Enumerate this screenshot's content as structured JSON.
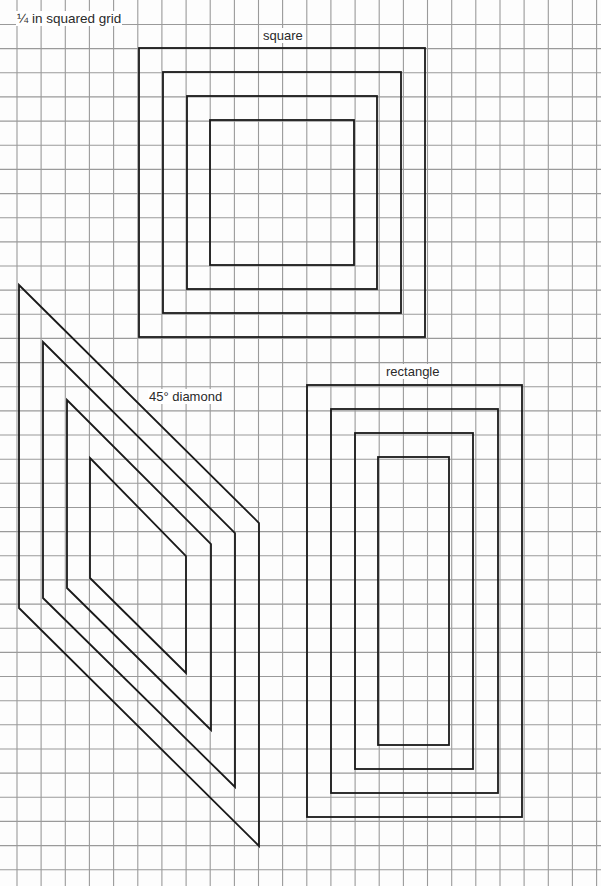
{
  "page": {
    "title": "¼ in squared grid",
    "width": 601,
    "height": 886,
    "background_color": "#fdfdfd"
  },
  "grid": {
    "spacing": 24.15,
    "x_start": 17,
    "y_start": 24.5,
    "line_color": "#9a9a9a",
    "line_width": 1.1
  },
  "shapes": {
    "stroke_color": "#1a1a1a",
    "stroke_width": 1.8,
    "square": {
      "label": "square",
      "label_pos": [
        262,
        28
      ],
      "rects": [
        {
          "x": 139,
          "y": 48,
          "w": 286,
          "h": 289
        },
        {
          "x": 163,
          "y": 72,
          "w": 238,
          "h": 241
        },
        {
          "x": 187,
          "y": 96,
          "w": 190,
          "h": 193
        },
        {
          "x": 210,
          "y": 120,
          "w": 144,
          "h": 145
        }
      ]
    },
    "rectangle": {
      "label": "rectangle",
      "label_pos": [
        385,
        364
      ],
      "rects": [
        {
          "x": 307,
          "y": 385,
          "w": 215,
          "h": 432
        },
        {
          "x": 331,
          "y": 409,
          "w": 167,
          "h": 384
        },
        {
          "x": 355,
          "y": 433,
          "w": 118,
          "h": 336
        },
        {
          "x": 378,
          "y": 457,
          "w": 71,
          "h": 288
        }
      ]
    },
    "diamond": {
      "label": "45° diamond",
      "label_pos": [
        148,
        389
      ],
      "polygons": [
        [
          [
            19,
            285
          ],
          [
            259,
            523
          ],
          [
            259,
            846
          ],
          [
            19,
            608
          ]
        ],
        [
          [
            43,
            342
          ],
          [
            235,
            533
          ],
          [
            235,
            787
          ],
          [
            43,
            598
          ]
        ],
        [
          [
            67,
            400
          ],
          [
            211,
            544
          ],
          [
            211,
            730
          ],
          [
            67,
            588
          ]
        ],
        [
          [
            90,
            458
          ],
          [
            186,
            556
          ],
          [
            186,
            673
          ],
          [
            90,
            578
          ]
        ]
      ]
    }
  }
}
